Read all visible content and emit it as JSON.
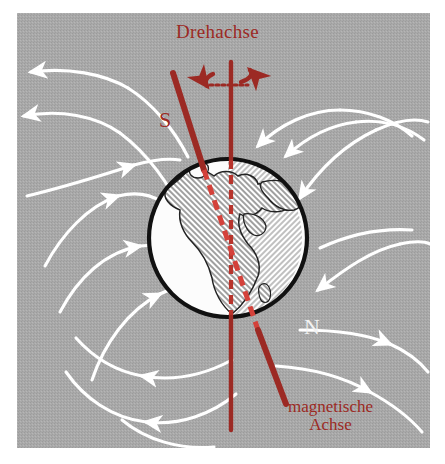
{
  "figure": {
    "topic": "Erdmagnetfeld",
    "background_color": "#a9a9a9",
    "frame_color": "#ffffff",
    "axis_red": "#9c2a24",
    "field_line_color": "#ffffff",
    "globe_outline_color": "#111111",
    "globe_ocean_color": "#fbfbfb",
    "globe_land_fill": "#c9c9c9"
  },
  "labels": {
    "rotation_axis": "Drehachse",
    "south_pole": "S",
    "north_pole": "N",
    "magnetic_axis_line1": "magnetische",
    "magnetic_axis_line2": "Achse"
  },
  "geometry": {
    "globe_center_x": 228,
    "globe_center_y": 238,
    "globe_radius": 80,
    "rotation_axis_x": 231,
    "rotation_axis_top_y": 62,
    "rotation_axis_bottom_y": 430,
    "magnetic_axis_top_x": 173,
    "magnetic_axis_top_y": 73,
    "magnetic_axis_bottom_x": 286,
    "magnetic_axis_bottom_y": 404,
    "magnetic_tilt_degrees": 11
  },
  "elements": {
    "rotation_arrow": "curved-rotation-arrow",
    "field_line_count": 10,
    "field_direction": "from north magnetic pole (lower right) around to south magnetic pole (upper left)"
  }
}
